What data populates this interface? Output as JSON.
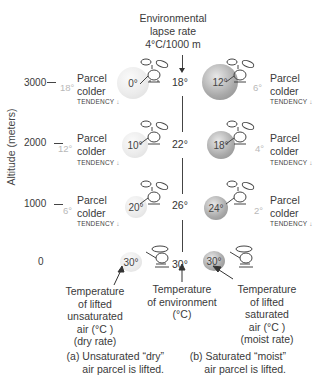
{
  "title": {
    "line1": "Environmental",
    "line2": "lapse rate",
    "line3": "4°C/1000 m"
  },
  "y_axis": {
    "label": "Altitude (meters)",
    "ticks": [
      "3000",
      "2000",
      "1000",
      "0"
    ]
  },
  "levels": [
    {
      "altitude": "3000",
      "dry_env_diff": "18°",
      "dry_parcel_temp": "0°",
      "env_temp": "18°",
      "moist_parcel_temp": "12°",
      "moist_env_diff": "6°",
      "label_line1": "Parcel",
      "label_line2": "colder",
      "tendency": "TENDENCY"
    },
    {
      "altitude": "2000",
      "dry_env_diff": "12°",
      "dry_parcel_temp": "10°",
      "env_temp": "22°",
      "moist_parcel_temp": "18°",
      "moist_env_diff": "4°",
      "label_line1": "Parcel",
      "label_line2": "colder",
      "tendency": "TENDENCY"
    },
    {
      "altitude": "1000",
      "dry_env_diff": "6°",
      "dry_parcel_temp": "20°",
      "env_temp": "26°",
      "moist_parcel_temp": "24°",
      "moist_env_diff": "2°",
      "label_line1": "Parcel",
      "label_line2": "colder",
      "tendency": "TENDENCY"
    },
    {
      "altitude": "0",
      "dry_parcel_temp": "30°",
      "env_temp": "30°",
      "moist_parcel_temp": "30°"
    }
  ],
  "annotations": {
    "dry": [
      "Temperature",
      "of lifted",
      "unsaturated",
      "air (°C )",
      "(dry rate)"
    ],
    "env": [
      "Temperature",
      "of environment",
      "(°C)"
    ],
    "moist": [
      "Temperature",
      "of lifted",
      "saturated",
      "air (°C )",
      "(moist rate)"
    ]
  },
  "captions": {
    "a_line1": "(a) Unsaturated “dry”",
    "a_line2": "air parcel is lifted.",
    "b_line1": "(b)  Saturated “moist”",
    "b_line2": "air parcel is lifted."
  },
  "colors": {
    "dry_balloon": "#e6e6e6",
    "moist_balloon": "#a0a0a0",
    "diff_text": "#b8b8b8",
    "text": "#3a3a3a"
  }
}
